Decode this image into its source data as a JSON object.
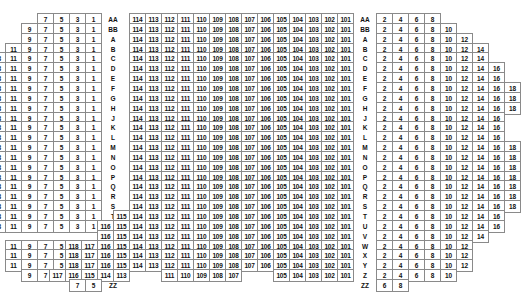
{
  "meta": {
    "sections": [
      "left",
      "center",
      "right"
    ],
    "row_label_columns": [
      "left-labels",
      "right-labels"
    ],
    "cell_width_px": 17,
    "cell_height_px": 13,
    "border_color": "#8a8a8a",
    "text_color": "#111111",
    "background_color": "#ffffff"
  },
  "rows": [
    {
      "label": "AA",
      "left": [
        7,
        5,
        3,
        1
      ],
      "center": [
        114,
        113,
        112,
        111,
        110,
        109,
        108,
        107,
        106,
        105,
        104,
        103,
        102,
        101
      ],
      "right": [
        2,
        4,
        6,
        8
      ]
    },
    {
      "label": "BB",
      "left": [
        9,
        7,
        5,
        3,
        1
      ],
      "center": [
        114,
        113,
        112,
        111,
        110,
        109,
        108,
        107,
        106,
        105,
        104,
        103,
        102,
        101
      ],
      "right": [
        2,
        4,
        6,
        8,
        10
      ]
    },
    {
      "label": "A",
      "left": [
        9,
        7,
        5,
        3,
        1
      ],
      "center": [
        114,
        113,
        112,
        111,
        110,
        109,
        108,
        107,
        106,
        105,
        104,
        103,
        102,
        101
      ],
      "right": [
        2,
        4,
        6,
        8,
        10,
        12
      ]
    },
    {
      "label": "B",
      "left": [
        11,
        9,
        7,
        5,
        3,
        1
      ],
      "center": [
        114,
        113,
        112,
        111,
        110,
        109,
        108,
        107,
        106,
        105,
        104,
        103,
        102,
        101
      ],
      "right": [
        2,
        4,
        6,
        8,
        10,
        12,
        14
      ]
    },
    {
      "label": "C",
      "left": [
        13,
        11,
        9,
        7,
        5,
        3,
        1
      ],
      "center": [
        114,
        113,
        112,
        111,
        110,
        109,
        108,
        107,
        106,
        105,
        104,
        103,
        102,
        101
      ],
      "right": [
        2,
        4,
        6,
        8,
        10,
        12,
        14
      ]
    },
    {
      "label": "D",
      "left": [
        15,
        13,
        11,
        9,
        7,
        5,
        3,
        1
      ],
      "center": [
        114,
        113,
        112,
        111,
        110,
        109,
        108,
        107,
        106,
        105,
        104,
        103,
        102,
        101
      ],
      "right": [
        2,
        4,
        6,
        8,
        10,
        12,
        14,
        16
      ]
    },
    {
      "label": "E",
      "left": [
        15,
        13,
        11,
        9,
        7,
        5,
        3,
        1
      ],
      "center": [
        114,
        113,
        112,
        111,
        110,
        109,
        108,
        107,
        106,
        105,
        104,
        103,
        102,
        101
      ],
      "right": [
        2,
        4,
        6,
        8,
        10,
        12,
        14,
        16
      ]
    },
    {
      "label": "F",
      "left": [
        17,
        15,
        13,
        11,
        9,
        7,
        5,
        3,
        1
      ],
      "center": [
        114,
        113,
        112,
        111,
        110,
        109,
        108,
        107,
        106,
        105,
        104,
        103,
        102,
        101
      ],
      "right": [
        2,
        4,
        6,
        8,
        10,
        12,
        14,
        16,
        18
      ]
    },
    {
      "label": "G",
      "left": [
        15,
        13,
        11,
        9,
        7,
        5,
        3,
        1
      ],
      "center": [
        114,
        113,
        112,
        111,
        110,
        109,
        108,
        107,
        106,
        105,
        104,
        103,
        102,
        101
      ],
      "right": [
        2,
        4,
        6,
        8,
        10,
        12,
        14,
        16,
        18
      ]
    },
    {
      "label": "H",
      "left": [
        15,
        13,
        11,
        9,
        7,
        5,
        3,
        1
      ],
      "center": [
        114,
        113,
        112,
        111,
        110,
        109,
        108,
        107,
        106,
        105,
        104,
        103,
        102,
        101
      ],
      "right": [
        2,
        4,
        6,
        8,
        10,
        12,
        14,
        16,
        18
      ]
    },
    {
      "label": "J",
      "left": [
        15,
        13,
        11,
        9,
        7,
        5,
        3,
        1
      ],
      "center": [
        114,
        113,
        112,
        111,
        110,
        109,
        108,
        107,
        106,
        105,
        104,
        103,
        102,
        101
      ],
      "right": [
        2,
        4,
        6,
        8,
        10,
        12,
        14,
        16
      ]
    },
    {
      "label": "K",
      "left": [
        15,
        13,
        11,
        9,
        7,
        5,
        3,
        1
      ],
      "center": [
        114,
        113,
        112,
        111,
        110,
        109,
        108,
        107,
        106,
        105,
        104,
        103,
        102,
        101
      ],
      "right": [
        2,
        4,
        6,
        8,
        10,
        12,
        14,
        16
      ]
    },
    {
      "label": "L",
      "left": [
        15,
        13,
        11,
        9,
        7,
        5,
        3,
        1
      ],
      "center": [
        114,
        113,
        112,
        111,
        110,
        109,
        108,
        107,
        106,
        105,
        104,
        103,
        102,
        101
      ],
      "right": [
        2,
        4,
        6,
        8,
        10,
        12,
        14,
        16
      ]
    },
    {
      "label": "M",
      "left": [
        17,
        15,
        13,
        11,
        9,
        7,
        5,
        3,
        1
      ],
      "center": [
        114,
        113,
        112,
        111,
        110,
        109,
        108,
        107,
        106,
        105,
        104,
        103,
        102,
        101
      ],
      "right": [
        2,
        4,
        6,
        8,
        10,
        12,
        14,
        16,
        18
      ]
    },
    {
      "label": "N",
      "left": [
        17,
        15,
        13,
        11,
        9,
        7,
        5,
        3,
        1
      ],
      "center": [
        114,
        113,
        112,
        111,
        110,
        109,
        108,
        107,
        106,
        105,
        104,
        103,
        102,
        101
      ],
      "right": [
        2,
        4,
        6,
        8,
        10,
        12,
        14,
        16,
        18
      ]
    },
    {
      "label": "O",
      "left": [
        17,
        15,
        13,
        11,
        9,
        7,
        5,
        3,
        1
      ],
      "center": [
        114,
        113,
        112,
        111,
        110,
        109,
        108,
        107,
        106,
        105,
        104,
        103,
        102,
        101
      ],
      "right": [
        2,
        4,
        6,
        8,
        10,
        12,
        14,
        16,
        18
      ]
    },
    {
      "label": "P",
      "left": [
        17,
        15,
        13,
        11,
        9,
        7,
        5,
        3,
        1
      ],
      "center": [
        114,
        113,
        112,
        111,
        110,
        109,
        108,
        107,
        106,
        105,
        104,
        103,
        102,
        101
      ],
      "right": [
        2,
        4,
        6,
        8,
        10,
        12,
        14,
        16,
        18
      ]
    },
    {
      "label": "Q",
      "left": [
        17,
        15,
        13,
        11,
        9,
        7,
        5,
        3,
        1
      ],
      "center": [
        114,
        113,
        112,
        111,
        110,
        109,
        108,
        107,
        106,
        105,
        104,
        103,
        102,
        101
      ],
      "right": [
        2,
        4,
        6,
        8,
        10,
        12,
        14,
        16,
        18
      ]
    },
    {
      "label": "R",
      "left": [
        17,
        15,
        13,
        11,
        9,
        7,
        5,
        3,
        1
      ],
      "center": [
        114,
        113,
        112,
        111,
        110,
        109,
        108,
        107,
        106,
        105,
        104,
        103,
        102,
        101
      ],
      "right": [
        2,
        4,
        6,
        8,
        10,
        12,
        14,
        16,
        18
      ]
    },
    {
      "label": "S",
      "left": [
        17,
        15,
        13,
        11,
        9,
        7,
        5,
        3,
        1
      ],
      "center": [
        114,
        113,
        112,
        111,
        110,
        109,
        108,
        107,
        106,
        105,
        104,
        103,
        102,
        101
      ],
      "right": [
        2,
        4,
        6,
        8,
        10,
        12,
        14,
        16,
        18
      ]
    },
    {
      "label": "T",
      "left": [
        15,
        13,
        11,
        9,
        7,
        5,
        3,
        1
      ],
      "center": [
        115,
        114,
        113,
        112,
        111,
        110,
        109,
        108,
        107,
        106,
        105,
        104,
        103,
        102,
        101
      ],
      "right": [
        2,
        4,
        6,
        8,
        10,
        12,
        14,
        16
      ]
    },
    {
      "label": "U",
      "left": [
        13,
        11,
        9,
        7,
        5,
        3,
        1
      ],
      "center": [
        116,
        115,
        114,
        113,
        112,
        111,
        110,
        109,
        108,
        107,
        106,
        105,
        104,
        103,
        102,
        101
      ],
      "right": [
        2,
        4,
        6,
        8,
        10,
        12,
        14,
        16
      ]
    },
    {
      "label": "V",
      "left": [],
      "center": [
        116,
        115,
        114,
        113,
        112,
        111,
        110,
        109,
        108,
        107,
        106,
        105,
        104,
        103,
        102,
        101
      ],
      "right": [
        2,
        4,
        6,
        8,
        10,
        12,
        14
      ]
    },
    {
      "label": "W",
      "left": [
        11,
        9,
        7,
        5,
        3,
        1
      ],
      "center": [
        118,
        117,
        116,
        115,
        114,
        113,
        112,
        111,
        110,
        109,
        108,
        107,
        106,
        105,
        104,
        103,
        102,
        101
      ],
      "right": [
        2,
        4,
        6,
        8,
        10,
        12
      ]
    },
    {
      "label": "X",
      "left": [
        11,
        9,
        7,
        5,
        3,
        1
      ],
      "center": [
        118,
        117,
        116,
        115,
        114,
        113,
        112,
        111,
        110,
        109,
        108,
        107,
        106,
        105,
        104,
        103,
        102,
        101
      ],
      "right": [
        2,
        4,
        6,
        8,
        10,
        12
      ]
    },
    {
      "label": "Y",
      "left": [
        11,
        9,
        7,
        5,
        3,
        1
      ],
      "center": [
        118,
        117,
        116,
        115,
        114,
        113,
        112,
        111,
        110,
        109,
        108,
        107,
        106,
        105,
        104,
        103,
        102,
        101
      ],
      "right": [
        2,
        4,
        6,
        8,
        10,
        12
      ]
    },
    {
      "label": "Z",
      "left": [
        9,
        7,
        5,
        3,
        1
      ],
      "center": [
        117,
        116,
        115,
        114,
        113,
        null,
        null,
        111,
        110,
        109,
        108,
        107,
        null,
        null,
        105,
        104,
        103,
        102,
        101
      ],
      "right": [
        2,
        4,
        6,
        8,
        10
      ]
    },
    {
      "label": "ZZ",
      "left": [
        7,
        5
      ],
      "center": [],
      "right": [
        6,
        8
      ]
    }
  ]
}
